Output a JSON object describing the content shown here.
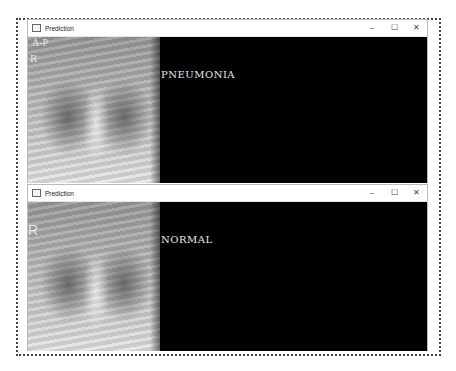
{
  "windows": [
    {
      "title": "Prediction",
      "controls": {
        "minimize": "–",
        "maximize": "☐",
        "close": "✕"
      },
      "prediction_label": "PNEUMONIA",
      "image_markers": [
        "A-P",
        "R"
      ]
    },
    {
      "title": "Prediction",
      "controls": {
        "minimize": "–",
        "maximize": "☐",
        "close": "✕"
      },
      "prediction_label": "NORMAL",
      "image_markers": [
        "R"
      ]
    }
  ]
}
